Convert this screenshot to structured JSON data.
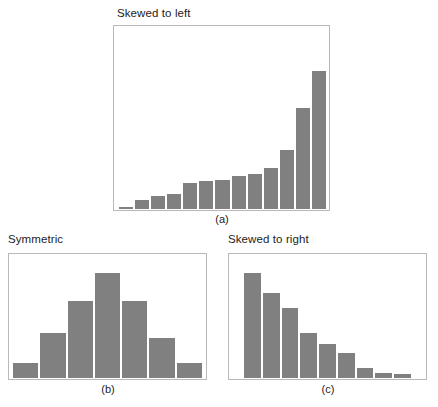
{
  "figure": {
    "background_color": "#ffffff",
    "bar_color": "#808080",
    "frame_color": "#b9b9b9",
    "bar_gap_color": "#ffffff"
  },
  "panels": [
    {
      "id": "a",
      "title": "Skewed to left",
      "caption": "(a)",
      "chart_data": {
        "type": "bar",
        "title": "Skewed to left",
        "xlabel": "",
        "ylabel": "",
        "grid": false,
        "legend": "none",
        "ylim": [
          0,
          100
        ],
        "categories": [
          "1",
          "2",
          "3",
          "4",
          "5",
          "6",
          "7",
          "8",
          "9",
          "10",
          "11",
          "12",
          "13"
        ],
        "values": [
          1,
          5,
          7,
          8,
          14,
          15,
          16,
          18,
          19,
          22,
          32,
          55,
          75
        ]
      }
    },
    {
      "id": "b",
      "title": "Symmetric",
      "caption": "(b)",
      "chart_data": {
        "type": "bar",
        "title": "Symmetric",
        "xlabel": "",
        "ylabel": "",
        "grid": false,
        "legend": "none",
        "ylim": [
          0,
          100
        ],
        "categories": [
          "1",
          "2",
          "3",
          "4",
          "5",
          "6",
          "7"
        ],
        "values": [
          12,
          36,
          62,
          84,
          62,
          32,
          12
        ]
      }
    },
    {
      "id": "c",
      "title": "Skewed to right",
      "caption": "(c)",
      "chart_data": {
        "type": "bar",
        "title": "Skewed to right",
        "xlabel": "",
        "ylabel": "",
        "grid": false,
        "legend": "none",
        "ylim": [
          0,
          100
        ],
        "categories": [
          "1",
          "2",
          "3",
          "4",
          "5",
          "6",
          "7",
          "8",
          "9"
        ],
        "values": [
          84,
          68,
          56,
          36,
          27,
          20,
          8,
          4,
          3
        ]
      }
    }
  ]
}
